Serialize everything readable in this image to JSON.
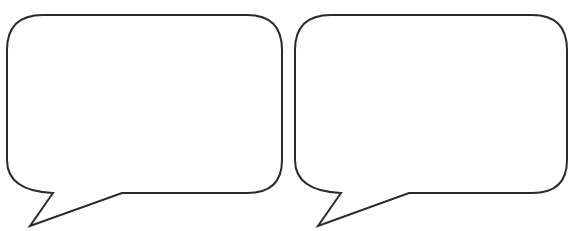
{
  "canvas": {
    "width": 569,
    "height": 231,
    "background": "#ffffff"
  },
  "stroke_color": "#2a2a2a",
  "bubbles": [
    {
      "id": "left",
      "text": ""
    },
    {
      "id": "right",
      "text": ""
    }
  ]
}
